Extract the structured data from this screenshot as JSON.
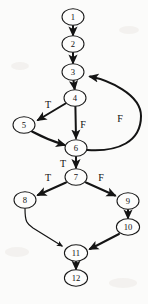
{
  "diagram": {
    "background_color": "#fbfbfa",
    "node_fill_color": "#fdfdfc",
    "node_stroke_color": "#181818",
    "edge_color": "#141414",
    "label_color": "#101010",
    "node_shape": "ellipse",
    "node_rx": 11,
    "node_ry": 8
  },
  "nodes": [
    {
      "id": "1",
      "label": "1",
      "x": 73,
      "y": 17
    },
    {
      "id": "2",
      "label": "2",
      "x": 73,
      "y": 44
    },
    {
      "id": "3",
      "label": "3",
      "x": 73,
      "y": 72
    },
    {
      "id": "4",
      "label": "4",
      "x": 75,
      "y": 98
    },
    {
      "id": "5",
      "label": "5",
      "x": 24,
      "y": 125
    },
    {
      "id": "6",
      "label": "6",
      "x": 76,
      "y": 148
    },
    {
      "id": "7",
      "label": "7",
      "x": 76,
      "y": 177
    },
    {
      "id": "8",
      "label": "8",
      "x": 25,
      "y": 200
    },
    {
      "id": "9",
      "label": "9",
      "x": 128,
      "y": 201
    },
    {
      "id": "10",
      "label": "10",
      "x": 128,
      "y": 227
    },
    {
      "id": "11",
      "label": "11",
      "x": 76,
      "y": 253
    },
    {
      "id": "12",
      "label": "12",
      "x": 76,
      "y": 278
    }
  ],
  "edges": [
    {
      "id": "e1-2",
      "from": "1",
      "to": "2",
      "label": "",
      "kind": "straight"
    },
    {
      "id": "e2-3",
      "from": "2",
      "to": "3",
      "label": "",
      "kind": "straight"
    },
    {
      "id": "e3-4",
      "from": "3",
      "to": "4",
      "label": "",
      "kind": "straight"
    },
    {
      "id": "e4-5",
      "from": "4",
      "to": "5",
      "label": "T",
      "kind": "straight"
    },
    {
      "id": "e4-6",
      "from": "4",
      "to": "6",
      "label": "F",
      "kind": "straight"
    },
    {
      "id": "e5-6",
      "from": "5",
      "to": "6",
      "label": "",
      "kind": "curve"
    },
    {
      "id": "e6-3",
      "from": "6",
      "to": "3",
      "label": "F",
      "kind": "backedge"
    },
    {
      "id": "e6-7",
      "from": "6",
      "to": "7",
      "label": "T",
      "kind": "straight"
    },
    {
      "id": "e7-8",
      "from": "7",
      "to": "8",
      "label": "T",
      "kind": "straight"
    },
    {
      "id": "e7-9",
      "from": "7",
      "to": "9",
      "label": "F",
      "kind": "straight"
    },
    {
      "id": "e8-11",
      "from": "8",
      "to": "11",
      "label": "",
      "kind": "curve"
    },
    {
      "id": "e9-10",
      "from": "9",
      "to": "10",
      "label": "",
      "kind": "straight"
    },
    {
      "id": "e10-11",
      "from": "10",
      "to": "11",
      "label": "",
      "kind": "straight"
    },
    {
      "id": "e11-12",
      "from": "11",
      "to": "12",
      "label": "",
      "kind": "straight"
    }
  ],
  "edge_labels": [
    {
      "id": "lbl-t-4-5",
      "text": "T",
      "x": 48,
      "y": 104
    },
    {
      "id": "lbl-f-4-6",
      "text": "F",
      "x": 83,
      "y": 124
    },
    {
      "id": "lbl-f-6-3",
      "text": "F",
      "x": 120,
      "y": 118
    },
    {
      "id": "lbl-t-6-7",
      "text": "T",
      "x": 63,
      "y": 163
    },
    {
      "id": "lbl-t-7-8",
      "text": "T",
      "x": 48,
      "y": 177
    },
    {
      "id": "lbl-f-7-9",
      "text": "F",
      "x": 101,
      "y": 177
    }
  ]
}
